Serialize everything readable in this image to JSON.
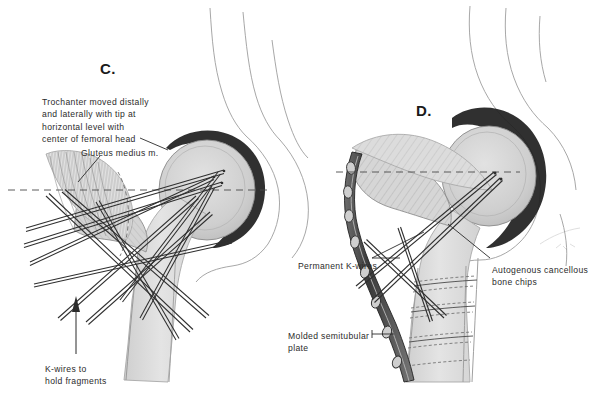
{
  "figure": {
    "background_color": "#ffffff",
    "ink_color": "#2b2b2b",
    "bone_fill": "#d8d8d8",
    "bone_fill_light": "#e8e8e8",
    "cortex_color": "#3a3a3a",
    "wire_color": "#2f2f2f",
    "artist_mark": "E.H.B."
  },
  "panels": [
    {
      "id": "panel-c",
      "letter": "C.",
      "letter_pos": {
        "x": 100,
        "y": 60
      },
      "labels": [
        {
          "name": "trochanter-note",
          "text": "Trochanter moved distally\nand laterally with tip at\nhorizontal level with\ncenter of femoral head",
          "x": 42,
          "y": 96
        },
        {
          "name": "gluteus-medius-label",
          "text": "Gluteus medius m.",
          "x": 81,
          "y": 147
        },
        {
          "name": "k-wires-fragments-label",
          "text": "K-wires to\nhold fragments",
          "x": 45,
          "y": 363
        }
      ]
    },
    {
      "id": "panel-d",
      "letter": "D.",
      "letter_pos": {
        "x": 416,
        "y": 102
      },
      "labels": [
        {
          "name": "permanent-k-wires-label",
          "text": "Permanent K-wires",
          "x": 298,
          "y": 260
        },
        {
          "name": "autogenous-bone-chips-label",
          "text": "Autogenous cancellous\nbone chips",
          "x": 492,
          "y": 264
        },
        {
          "name": "molded-plate-label",
          "text": "Molded semitubular\nplate",
          "x": 288,
          "y": 330
        }
      ]
    }
  ]
}
